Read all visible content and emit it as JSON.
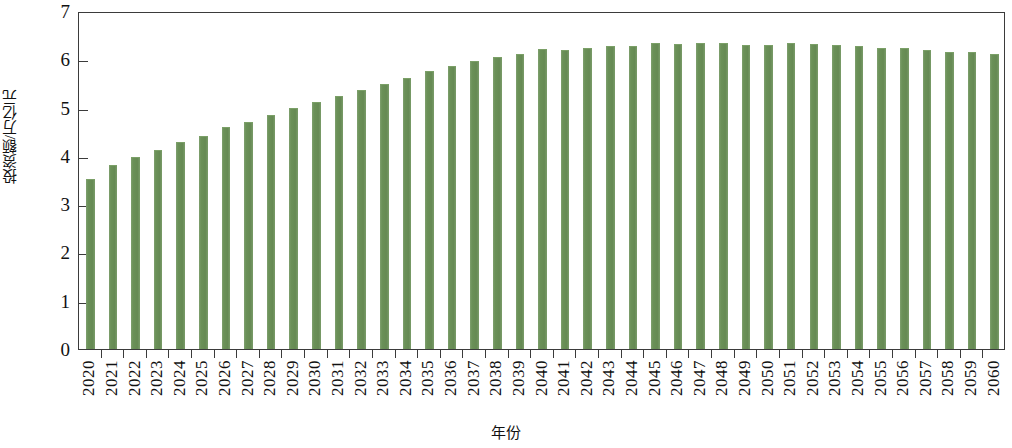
{
  "chart_data": {
    "type": "bar",
    "title": "",
    "xlabel": "年份",
    "ylabel": "投资额/万亿元",
    "ylim": [
      0,
      7
    ],
    "yticks": [
      0,
      1,
      2,
      3,
      4,
      5,
      6,
      7
    ],
    "ytick_labels": [
      "0",
      "1",
      "2",
      "3",
      "4",
      "5",
      "6",
      "7"
    ],
    "grid": false,
    "legend": null,
    "bar_color": "#6b9158",
    "axis_color": "#3b3b3b",
    "categories": [
      "2020",
      "2021",
      "2022",
      "2023",
      "2024",
      "2025",
      "2026",
      "2027",
      "2028",
      "2029",
      "2030",
      "2031",
      "2032",
      "2033",
      "2034",
      "2035",
      "2036",
      "2037",
      "2038",
      "2039",
      "2040",
      "2041",
      "2042",
      "2043",
      "2044",
      "2045",
      "2046",
      "2047",
      "2048",
      "2049",
      "2050",
      "2051",
      "2052",
      "2053",
      "2054",
      "2055",
      "2056",
      "2057",
      "2058",
      "2059",
      "2060"
    ],
    "values": [
      3.5,
      3.8,
      3.95,
      4.1,
      4.26,
      4.4,
      4.58,
      4.68,
      4.82,
      4.98,
      5.1,
      5.21,
      5.35,
      5.47,
      5.6,
      5.73,
      5.85,
      5.94,
      6.03,
      6.08,
      6.19,
      6.17,
      6.22,
      6.25,
      6.25,
      6.31,
      6.3,
      6.31,
      6.31,
      6.27,
      6.27,
      6.31,
      6.29,
      6.28,
      6.26,
      6.22,
      6.21,
      6.18,
      6.14,
      6.13,
      6.08
    ]
  }
}
